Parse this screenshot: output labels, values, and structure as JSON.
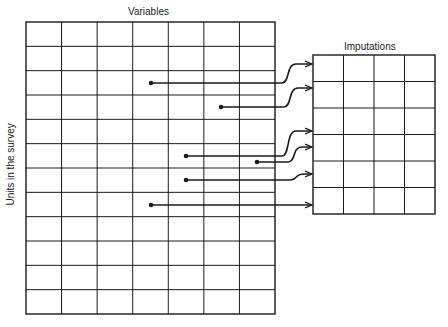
{
  "diagram": {
    "labels": {
      "variables": "Variables",
      "imputations": "Imputations",
      "units": "Units in the survey"
    },
    "data_matrix": {
      "columns": 7,
      "rows": 12,
      "x": 26,
      "y": 22,
      "width": 249,
      "height": 292
    },
    "imputation_matrix": {
      "columns": 4,
      "rows": 6,
      "x": 313,
      "y": 55,
      "width": 122,
      "height": 159
    },
    "connections": [
      {
        "from": [
          151,
          83
        ],
        "to_y": 64,
        "bend_x": 288
      },
      {
        "from": [
          221,
          107
        ],
        "to_y": 88,
        "bend_x": 290
      },
      {
        "from": [
          186,
          156
        ],
        "to_y": 131,
        "bend_x": 288
      },
      {
        "from": [
          257,
          162
        ],
        "to_y": 147,
        "bend_x": 294
      },
      {
        "from": [
          186,
          180
        ],
        "to_y": 174,
        "bend_x": 296
      },
      {
        "from": [
          151,
          205
        ],
        "to_y": 205,
        "bend_x": 0
      }
    ],
    "colors": {
      "line": "#1a1a1a",
      "background": "#ffffff"
    }
  }
}
